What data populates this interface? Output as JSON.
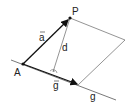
{
  "diagram": {
    "labels": {
      "point_A": "A",
      "point_P": "P",
      "vector_a": "a",
      "vector_g": "g",
      "distance": "d",
      "line": "g"
    },
    "colors": {
      "stroke": "#111111",
      "thin_stroke": "#555555",
      "background": "#ffffff"
    }
  }
}
